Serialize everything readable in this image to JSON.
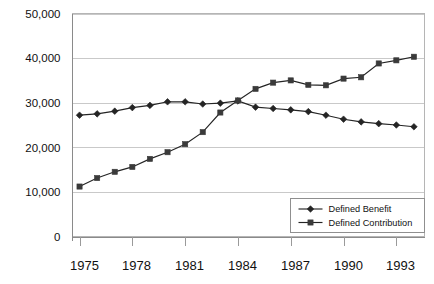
{
  "chart_data": {
    "type": "line",
    "title": "",
    "xlabel": "",
    "ylabel": "",
    "x": [
      1975,
      1976,
      1977,
      1978,
      1979,
      1980,
      1981,
      1982,
      1983,
      1984,
      1985,
      1986,
      1987,
      1988,
      1989,
      1990,
      1991,
      1992,
      1993,
      1994
    ],
    "xlim": [
      1974.6,
      1994.6
    ],
    "ylim": [
      0,
      50000
    ],
    "yticks": [
      0,
      10000,
      20000,
      30000,
      40000,
      50000
    ],
    "ytick_labels": [
      "0",
      "10,000",
      "20,000",
      "30,000",
      "40,000",
      "50,000"
    ],
    "xticks": [
      1975,
      1978,
      1981,
      1984,
      1987,
      1990,
      1993
    ],
    "xtick_labels": [
      "1975",
      "1978",
      "1981",
      "1984",
      "1987",
      "1990",
      "1993"
    ],
    "grid": "horizontal",
    "legend_position": "lower-right",
    "series": [
      {
        "name": "Defined Benefit",
        "marker": "diamond",
        "color": "#242424",
        "values": [
          27200,
          27500,
          28100,
          28900,
          29400,
          30200,
          30200,
          29700,
          29900,
          30400,
          29000,
          28700,
          28400,
          28000,
          27200,
          26300,
          25700,
          25300,
          25000,
          24600
        ]
      },
      {
        "name": "Defined Contribution",
        "marker": "square",
        "color": "#3a3a3a",
        "values": [
          11200,
          13100,
          14500,
          15600,
          17400,
          18900,
          20700,
          23400,
          27800,
          30500,
          33100,
          34500,
          35000,
          34000,
          33900,
          35400,
          35700,
          38800,
          39500,
          40300
        ]
      }
    ]
  },
  "legend": {
    "items": [
      {
        "label": "Defined Benefit",
        "marker": "diamond"
      },
      {
        "label": "Defined Contribution",
        "marker": "square"
      }
    ]
  }
}
